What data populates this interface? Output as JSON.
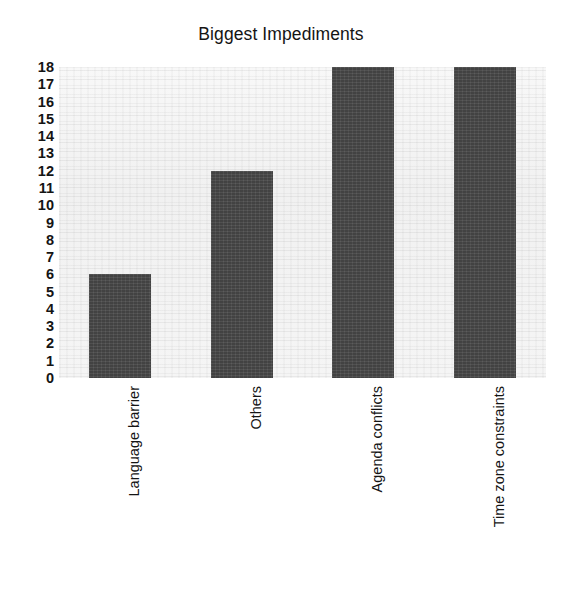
{
  "chart_data": {
    "type": "bar",
    "title": "Biggest Impediments",
    "xlabel": "",
    "ylabel": "",
    "categories": [
      "Language barrier",
      "Others",
      "Agenda conflicts",
      "Time zone constraints"
    ],
    "values": [
      6,
      12,
      18,
      18
    ],
    "ylim": [
      0,
      18
    ],
    "ytick_step": 1,
    "yticks": [
      "18",
      "17",
      "16",
      "15",
      "14",
      "13",
      "12",
      "11",
      "10",
      "9",
      "8",
      "7",
      "6",
      "5",
      "4",
      "3",
      "2",
      "1",
      "0"
    ],
    "grid": false,
    "legend": false,
    "legend_position": "none",
    "orientation": "vertical",
    "xtick_rotation": 90,
    "colors": {
      "bar_fill": "#4b4b4b",
      "plot_background": "#f4f4f4",
      "figure_background": "#ffffff",
      "text": "#141414"
    }
  }
}
